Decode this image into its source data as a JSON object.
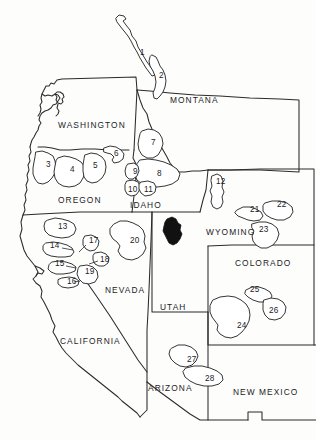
{
  "map": {
    "title": "Western United States study areas",
    "region": "Pacific Northwest and Intermountain West",
    "background_color": "#fdfdfc",
    "line_color": "#2b2b2b",
    "fill_color": "#111111",
    "projection_note": "state outline line drawing",
    "states": [
      {
        "id": "montana",
        "label": "MONTANA",
        "x": 170,
        "y": 103
      },
      {
        "id": "washington",
        "label": "WASHINGTON",
        "x": 58,
        "y": 128
      },
      {
        "id": "oregon",
        "label": "OREGON",
        "x": 58,
        "y": 203
      },
      {
        "id": "idaho",
        "label": "IDAHO",
        "x": 130,
        "y": 208
      },
      {
        "id": "wyoming",
        "label": "WYOMING",
        "x": 206,
        "y": 235
      },
      {
        "id": "colorado",
        "label": "COLORADO",
        "x": 235,
        "y": 266
      },
      {
        "id": "nevada",
        "label": "NEVADA",
        "x": 105,
        "y": 293
      },
      {
        "id": "utah",
        "label": "UTAH",
        "x": 160,
        "y": 310
      },
      {
        "id": "california",
        "label": "CALIFORNIA",
        "x": 60,
        "y": 344
      },
      {
        "id": "arizona",
        "label": "ARIZONA",
        "x": 148,
        "y": 391
      },
      {
        "id": "new-mexico",
        "label": "NEW MEXICO",
        "x": 233,
        "y": 395
      }
    ],
    "numbered_areas": [
      {
        "n": "1",
        "label_x": 140,
        "label_y": 55,
        "state": "montana"
      },
      {
        "n": "2",
        "label_x": 159,
        "label_y": 78,
        "state": "montana"
      },
      {
        "n": "3",
        "label_x": 46,
        "label_y": 167,
        "state": "oregon"
      },
      {
        "n": "4",
        "label_x": 70,
        "label_y": 172,
        "state": "oregon"
      },
      {
        "n": "5",
        "label_x": 93,
        "label_y": 168,
        "state": "oregon"
      },
      {
        "n": "6",
        "label_x": 114,
        "label_y": 156,
        "state": "oregon"
      },
      {
        "n": "7",
        "label_x": 151,
        "label_y": 145,
        "state": "idaho"
      },
      {
        "n": "8",
        "label_x": 157,
        "label_y": 176,
        "state": "idaho"
      },
      {
        "n": "9",
        "label_x": 133,
        "label_y": 174,
        "state": "idaho"
      },
      {
        "n": "10",
        "label_x": 130,
        "label_y": 192,
        "state": "idaho"
      },
      {
        "n": "11",
        "label_x": 146,
        "label_y": 192,
        "state": "idaho"
      },
      {
        "n": "12",
        "label_x": 219,
        "label_y": 184,
        "state": "wyoming"
      },
      {
        "n": "13",
        "label_x": 60,
        "label_y": 229,
        "state": "california"
      },
      {
        "n": "14",
        "label_x": 53,
        "label_y": 248,
        "state": "california"
      },
      {
        "n": "15",
        "label_x": 58,
        "label_y": 266,
        "state": "california"
      },
      {
        "n": "16",
        "label_x": 70,
        "label_y": 284,
        "state": "california"
      },
      {
        "n": "17",
        "label_x": 91,
        "label_y": 243,
        "state": "nevada"
      },
      {
        "n": "18",
        "label_x": 102,
        "label_y": 262,
        "state": "nevada"
      },
      {
        "n": "19",
        "label_x": 87,
        "label_y": 274,
        "state": "nevada"
      },
      {
        "n": "20",
        "label_x": 133,
        "label_y": 243,
        "state": "nevada"
      },
      {
        "n": "21",
        "label_x": 254,
        "label_y": 212,
        "state": "wyoming"
      },
      {
        "n": "22",
        "label_x": 281,
        "label_y": 207,
        "state": "wyoming"
      },
      {
        "n": "23",
        "label_x": 263,
        "label_y": 232,
        "state": "wyoming"
      },
      {
        "n": "24",
        "label_x": 241,
        "label_y": 328,
        "state": "utah"
      },
      {
        "n": "25",
        "label_x": 254,
        "label_y": 292,
        "state": "colorado"
      },
      {
        "n": "26",
        "label_x": 273,
        "label_y": 313,
        "state": "colorado"
      },
      {
        "n": "27",
        "label_x": 190,
        "label_y": 362,
        "state": "arizona"
      },
      {
        "n": "28",
        "label_x": 208,
        "label_y": 381,
        "state": "arizona"
      }
    ],
    "filled_area": {
      "id": "filled-polygon-utah",
      "description": "solid black area in northern Utah",
      "x": 172,
      "y": 230
    }
  }
}
